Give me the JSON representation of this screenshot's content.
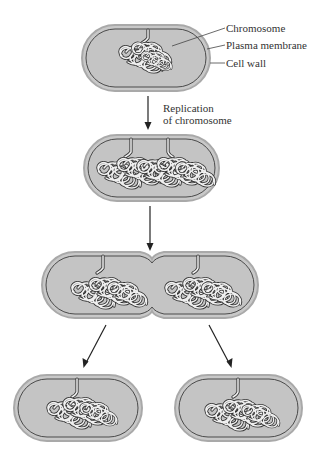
{
  "diagram": {
    "type": "bacterial binary fission",
    "labels": {
      "chromosome": "Chromosome",
      "plasma_membrane": "Plasma membrane",
      "cell_wall": "Cell wall"
    },
    "steps": [
      {
        "id": "parent-cell",
        "description": "Cell with single chromosome attached to plasma membrane"
      },
      {
        "id": "replicated-cell",
        "description": "Elongated cell with two chromosome copies"
      },
      {
        "id": "dividing-cell",
        "description": "Cell constricting in middle with chromosomes separated"
      },
      {
        "id": "daughter-cell-left",
        "description": "Daughter cell"
      },
      {
        "id": "daughter-cell-right",
        "description": "Daughter cell"
      }
    ],
    "arrow_labels": {
      "replication_line1": "Replication",
      "replication_line2": "of chromosome"
    },
    "colors": {
      "cytoplasm": "#c6c6c6",
      "cell_wall": "#a9a9a9",
      "membrane": "#4a4a4a",
      "chromosome": "#333333"
    }
  }
}
